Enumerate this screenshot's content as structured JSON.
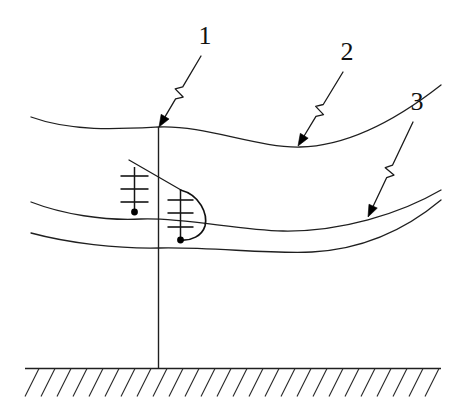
{
  "figure": {
    "background_color": "#ffffff",
    "line_color": "#1a1a1a",
    "width": 451,
    "height": 409
  },
  "callouts": [
    {
      "id": "callout-1",
      "label": "1",
      "label_x": 205,
      "label_y": 44,
      "target_x": 159,
      "target_y": 127,
      "description": "pole top attachment point"
    },
    {
      "id": "callout-2",
      "label": "2",
      "label_x": 347,
      "label_y": 60,
      "target_x": 298,
      "target_y": 146,
      "description": "upper conductor"
    },
    {
      "id": "callout-3",
      "label": "3",
      "label_x": 417,
      "label_y": 110,
      "target_x": 368,
      "target_y": 217,
      "description": "lower conductor"
    }
  ],
  "pole": {
    "name": "utility-pole",
    "x": 158.5,
    "top_y": 127,
    "bottom_y": 369
  },
  "conductors": [
    {
      "name": "conductor-upper",
      "path": "M 31 117 C 72 132 120 129 158.5 127 C 205 125 258 148 300 147 C 352 146 404 114 441 85"
    },
    {
      "name": "conductor-middle",
      "path": "M 31 202 C 62 214 104 221 141 219 C 180 217 238 230 283 231 C 340 232 400 214 441 190"
    },
    {
      "name": "conductor-lower",
      "path": "M 31 233 C 68 243 118 249 160 248 C 212 247 268 254 312 252 C 368 249 410 226 441 200"
    }
  ],
  "insulator_strings": [
    {
      "name": "insulator-string-left",
      "stem_x": 134.5,
      "stem_top_y": 167,
      "stem_bottom_y": 212,
      "bar_half_width": 14,
      "bars_y": [
        176,
        189,
        202
      ],
      "dot_x": 134.5,
      "dot_y": 212,
      "dot_r": 3.4
    },
    {
      "name": "insulator-string-right",
      "stem_x": 180.5,
      "stem_top_y": 190,
      "stem_bottom_y": 240,
      "bar_half_width": 13,
      "bars_y": [
        200,
        213,
        227
      ],
      "dot_x": 180.5,
      "dot_y": 240,
      "dot_r": 3.4
    }
  ],
  "jumper_arc": {
    "name": "jumper-loop-arc",
    "path": "M 180.5 190 C 200 195 208 214 205 226 C 202 236 191 241 180.5 240"
  },
  "brace": {
    "name": "diagonal-brace",
    "path": "M 129 160 L 181 190"
  },
  "ground": {
    "name": "ground-level",
    "line_y": 368.5,
    "x_start": 25,
    "x_end": 441,
    "hatch_count": 26,
    "hatch_length": 30,
    "hatch_angle_dx": -14,
    "hatch_angle_dy": 28
  }
}
